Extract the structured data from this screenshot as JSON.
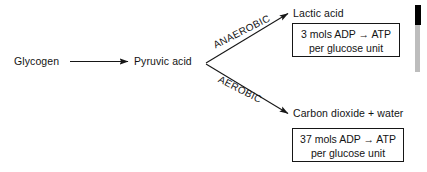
{
  "diagram": {
    "stroke_color": "#161616",
    "background_color": "#ffffff",
    "nodes": {
      "start": "Glycogen",
      "intermediate": "Pyruvic acid",
      "anaerobic_product": "Lactic acid",
      "aerobic_product": "Carbon dioxide + water"
    },
    "path_labels": {
      "anaerobic": "ANAEROBIC",
      "aerobic": "AEROBIC"
    },
    "yield_boxes": {
      "anaerobic": {
        "line1": "3 mols ADP → ATP",
        "line2": "per glucose unit"
      },
      "aerobic": {
        "line1": "37 mols ADP → ATP",
        "line2": "per glucose unit"
      }
    },
    "arrows": {
      "main": "arrow-glycogen-to-pyruvic",
      "upper_branch": "arrow-pyruvic-to-lactic",
      "lower_branch": "arrow-pyruvic-to-carbon-dioxide"
    },
    "artifact": "scan-edge-artifact"
  }
}
